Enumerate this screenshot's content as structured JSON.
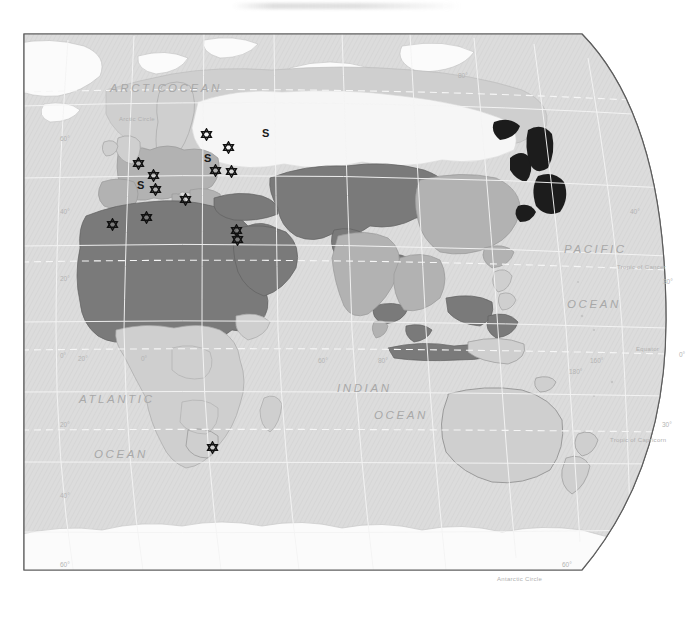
{
  "document": {
    "kind": "world-map",
    "title": "",
    "projection": "oblique-globe",
    "background_color": "#ffffff",
    "frame_color": "#555555"
  },
  "palette": {
    "ocean": "#dcdcdc",
    "land_light": "#cfcfcf",
    "land_medium": "#b2b2b2",
    "land_dark": "#7a7a7a",
    "land_darkest": "#1c1c1c",
    "land_white": "#f4f4f4",
    "graticule": "#f2f2f2",
    "label": "#b0b0b0",
    "ocean_label": "#a8a8a8",
    "marker": "#111111"
  },
  "ocean_labels": [
    {
      "text": "ARCTIC",
      "x": 88,
      "y": 52
    },
    {
      "text": "OCEAN",
      "x": 146,
      "y": 52
    },
    {
      "text": "PACIFIC",
      "x": 542,
      "y": 213
    },
    {
      "text": "OCEAN",
      "x": 545,
      "y": 268
    },
    {
      "text": "ATLANTIC",
      "x": 57,
      "y": 363
    },
    {
      "text": "OCEAN",
      "x": 72,
      "y": 418
    },
    {
      "text": "INDIAN",
      "x": 315,
      "y": 352
    },
    {
      "text": "OCEAN",
      "x": 352,
      "y": 379
    }
  ],
  "special_lines": [
    {
      "text": "Arctic Circle",
      "x": 97,
      "y": 86
    },
    {
      "text": "Tropic of Cancer",
      "x": 595,
      "y": 234
    },
    {
      "text": "Equator",
      "x": 614,
      "y": 316
    },
    {
      "text": "Tropic of Capricorn",
      "x": 588,
      "y": 407
    },
    {
      "text": "Antarctic Circle",
      "x": 475,
      "y": 546
    }
  ],
  "graticule_labels": [
    {
      "text": "80°",
      "x": 436,
      "y": 42
    },
    {
      "text": "60°",
      "x": 38,
      "y": 105
    },
    {
      "text": "40°",
      "x": 38,
      "y": 178
    },
    {
      "text": "20°",
      "x": 38,
      "y": 245
    },
    {
      "text": "0°",
      "x": 38,
      "y": 322
    },
    {
      "text": "20°",
      "x": 38,
      "y": 391
    },
    {
      "text": "40°",
      "x": 38,
      "y": 462
    },
    {
      "text": "60°",
      "x": 38,
      "y": 531
    },
    {
      "text": "40°",
      "x": 608,
      "y": 178
    },
    {
      "text": "30°",
      "x": 641,
      "y": 248
    },
    {
      "text": "0°",
      "x": 657,
      "y": 321
    },
    {
      "text": "30°",
      "x": 640,
      "y": 391
    },
    {
      "text": "60°",
      "x": 540,
      "y": 531
    },
    {
      "text": "20°",
      "x": 56,
      "y": 325
    },
    {
      "text": "0°",
      "x": 119,
      "y": 325
    },
    {
      "text": "60°",
      "x": 296,
      "y": 327
    },
    {
      "text": "80°",
      "x": 356,
      "y": 327
    },
    {
      "text": "160°",
      "x": 568,
      "y": 327
    },
    {
      "text": "180°",
      "x": 547,
      "y": 338
    }
  ],
  "markers": {
    "star_of_david": [
      {
        "id": "star-norway-sweden",
        "x": 184,
        "y": 103
      },
      {
        "id": "star-baltic-north",
        "x": 206,
        "y": 116
      },
      {
        "id": "star-baltic-south",
        "x": 193,
        "y": 139
      },
      {
        "id": "star-belarus",
        "x": 209,
        "y": 140
      },
      {
        "id": "star-britain",
        "x": 116,
        "y": 132
      },
      {
        "id": "star-netherlands",
        "x": 131,
        "y": 144
      },
      {
        "id": "star-france",
        "x": 133,
        "y": 158
      },
      {
        "id": "star-italy-adriatic",
        "x": 163,
        "y": 168
      },
      {
        "id": "star-morocco",
        "x": 90,
        "y": 193
      },
      {
        "id": "star-algeria-tunisia",
        "x": 124,
        "y": 186
      },
      {
        "id": "star-levant-upper",
        "x": 214,
        "y": 199
      },
      {
        "id": "star-levant-lower",
        "x": 215,
        "y": 208
      },
      {
        "id": "star-south-africa",
        "x": 190,
        "y": 416
      }
    ],
    "s_letters": [
      {
        "id": "s-russia-north",
        "x": 243,
        "y": 104
      },
      {
        "id": "s-russia-central",
        "x": 185,
        "y": 129
      },
      {
        "id": "s-spain",
        "x": 118,
        "y": 156
      }
    ]
  }
}
